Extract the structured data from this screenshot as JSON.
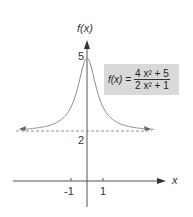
{
  "chart_data": {
    "type": "line",
    "title": "",
    "xlabel": "x",
    "ylabel": "f(x)",
    "function": "f(x) = (4x^2+5)/(2x^2+1)",
    "formula_label": {
      "lhs": "f(x) =",
      "numerator": "4 x² + 5",
      "denominator": "2 x² + 1"
    },
    "x_ticks": [
      "-1",
      "1"
    ],
    "y_ticks": [
      "2",
      "5"
    ],
    "asymptote": {
      "type": "horizontal",
      "y": 2,
      "style": "dashed"
    },
    "xlim": [
      -5,
      5
    ],
    "ylim": [
      -1,
      5.5
    ],
    "series": [
      {
        "name": "f(x)",
        "x": [
          -4.5,
          -3,
          -2,
          -1.5,
          -1,
          -0.5,
          0,
          0.5,
          1,
          1.5,
          2,
          3,
          4.5
        ],
        "values": [
          2.05,
          2.16,
          2.33,
          2.55,
          3,
          4,
          5,
          4,
          3,
          2.55,
          2.33,
          2.16,
          2.05
        ]
      }
    ]
  }
}
